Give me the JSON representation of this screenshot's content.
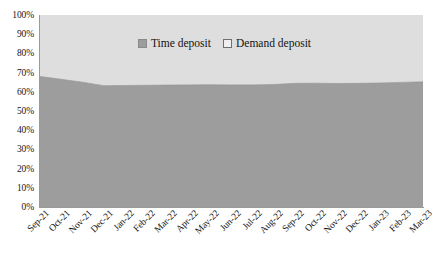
{
  "chart_data": {
    "type": "area",
    "title": "",
    "subtitle": "",
    "xlabel": "",
    "ylabel": "",
    "stacked": true,
    "percent_stacked": true,
    "grid": false,
    "legend_position": "top-center",
    "ylim": [
      0,
      100
    ],
    "ytick_labels": [
      "100%",
      "90%",
      "80%",
      "70%",
      "60%",
      "50%",
      "40%",
      "30%",
      "20%",
      "10%",
      "0%"
    ],
    "ytick_values": [
      100,
      90,
      80,
      70,
      60,
      50,
      40,
      30,
      20,
      10,
      0
    ],
    "categories": [
      "Sep-21",
      "Oct-21",
      "Nov-21",
      "Dec-21",
      "Jan-22",
      "Feb-22",
      "Mar-22",
      "Apr-22",
      "May-22",
      "Jun-22",
      "Jul-22",
      "Aug-22",
      "Sep-22",
      "Oct-22",
      "Nov-22",
      "Dec-22",
      "Jan-23",
      "Feb-23",
      "Mar-23"
    ],
    "series": [
      {
        "name": "Time deposit",
        "color": "#9d9d9d",
        "values": [
          68.0,
          66.5,
          65.0,
          63.2,
          63.3,
          63.4,
          63.5,
          63.6,
          63.7,
          63.6,
          63.6,
          63.8,
          64.4,
          64.5,
          64.3,
          64.4,
          64.6,
          64.9,
          65.2
        ]
      },
      {
        "name": "Demand deposit",
        "color": "#dedede",
        "values": [
          32.0,
          33.5,
          35.0,
          36.8,
          36.7,
          36.6,
          36.5,
          36.4,
          36.3,
          36.4,
          36.4,
          36.2,
          35.6,
          35.5,
          35.7,
          35.6,
          35.4,
          35.1,
          34.8
        ]
      }
    ]
  },
  "colors": {
    "time_deposit": "#9d9d9d",
    "demand_deposit": "#dedede",
    "axis": "#9a9a9a",
    "text": "#161616",
    "background": "#ffffff"
  },
  "legend": {
    "items": [
      {
        "label": "Time deposit",
        "swatch": "filled"
      },
      {
        "label": "Demand deposit",
        "swatch": "hollow"
      }
    ]
  }
}
